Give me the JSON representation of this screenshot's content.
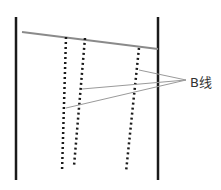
{
  "diagram": {
    "label": "B线",
    "colors": {
      "border": "#1a1a1a",
      "pleura": "#8a8a8a",
      "dots": "#1a1a1a",
      "pointer": "#9a9a9a"
    }
  }
}
